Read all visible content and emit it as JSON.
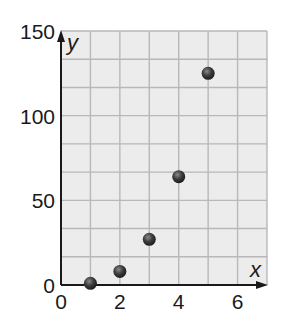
{
  "chart_data": {
    "type": "scatter",
    "title": "",
    "xlabel": "x",
    "ylabel": "y",
    "xlim": [
      0,
      7
    ],
    "ylim": [
      0,
      150
    ],
    "x_ticks": [
      0,
      2,
      4,
      6
    ],
    "y_ticks": [
      0,
      50,
      100,
      150
    ],
    "x_tick_labels": [
      "0",
      "2",
      "4",
      "6"
    ],
    "y_tick_labels": [
      "0",
      "50",
      "100",
      "150"
    ],
    "grid": true,
    "grid_x_step": 1,
    "grid_y_step": 16.6667,
    "legend": null,
    "series": [
      {
        "name": "points",
        "x": [
          1,
          2,
          3,
          4,
          5
        ],
        "y": [
          1,
          8,
          27,
          64,
          125
        ]
      }
    ]
  },
  "colors": {
    "grid_background": "#ececec",
    "grid_line": "#b8b8b8",
    "axis": "#1a1a1a",
    "point": "#3a3a3a"
  }
}
